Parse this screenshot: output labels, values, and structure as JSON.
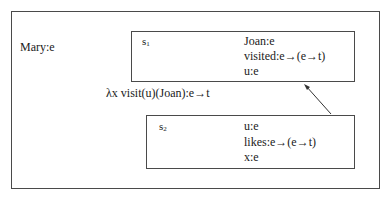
{
  "diagram": {
    "outer": {
      "label": "Mary:e"
    },
    "s1": {
      "name": "s",
      "index": "1",
      "conditions": [
        "Joan:e",
        "visited:e→(e→t)",
        "u:e"
      ]
    },
    "s2": {
      "name": "s",
      "index": "2",
      "conditions": [
        "u:e",
        "likes:e→(e→t)",
        "x:e"
      ]
    },
    "link_label": "λx visit(u)(Joan):e→t",
    "arrow": {
      "from": "s2",
      "to": "s1"
    }
  }
}
